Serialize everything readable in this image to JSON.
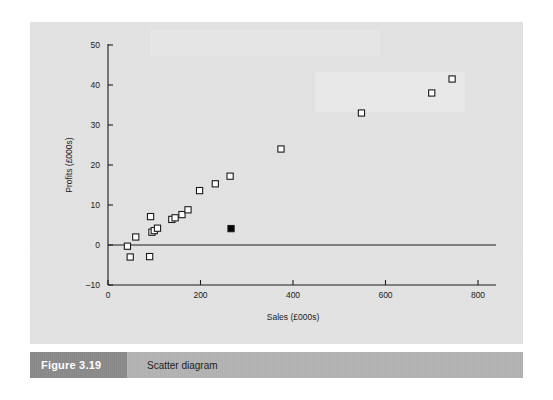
{
  "figure": {
    "caption_number": "Figure 3.19",
    "caption_title": "Scatter diagram"
  },
  "colors": {
    "panel_background": "#e3e3e3",
    "caption_number_bg": "#8b8b8b",
    "caption_bar_bg": "#b4b4b4",
    "axis": "#1a1a1a",
    "marker_open": "#ffffff",
    "marker_outline": "#1a1a1a",
    "marker_highlight": "#000000",
    "page_background": "#ffffff"
  },
  "chart_data": {
    "type": "scatter",
    "title": "",
    "xlabel": "Sales (£000s)",
    "ylabel": "Profits (£000s)",
    "xlim": [
      0,
      800
    ],
    "ylim": [
      -10,
      50
    ],
    "xticks": [
      0,
      200,
      400,
      600,
      800
    ],
    "yticks": [
      -10,
      0,
      10,
      20,
      30,
      40,
      50
    ],
    "xtick_labels": [
      "0",
      "200",
      "400",
      "600",
      "800"
    ],
    "ytick_labels": [
      "–10",
      "0",
      "10",
      "20",
      "30",
      "40",
      "50"
    ],
    "grid": false,
    "legend": "none",
    "zero_line": 0,
    "series": [
      {
        "name": "Branches",
        "marker": "open-square",
        "points": [
          {
            "x": 42,
            "y": -0.3
          },
          {
            "x": 48,
            "y": -3.0
          },
          {
            "x": 60,
            "y": 2.0
          },
          {
            "x": 90,
            "y": -2.9
          },
          {
            "x": 92,
            "y": 7.1
          },
          {
            "x": 95,
            "y": 3.2
          },
          {
            "x": 100,
            "y": 3.6
          },
          {
            "x": 107,
            "y": 4.2
          },
          {
            "x": 138,
            "y": 6.4
          },
          {
            "x": 145,
            "y": 6.8
          },
          {
            "x": 160,
            "y": 7.6
          },
          {
            "x": 173,
            "y": 8.8
          },
          {
            "x": 198,
            "y": 13.6
          },
          {
            "x": 232,
            "y": 15.3
          },
          {
            "x": 264,
            "y": 17.2
          },
          {
            "x": 374,
            "y": 24.0
          },
          {
            "x": 548,
            "y": 33.0
          },
          {
            "x": 700,
            "y": 38.0
          },
          {
            "x": 744,
            "y": 41.5
          }
        ]
      },
      {
        "name": "Highlighted branch",
        "marker": "filled-square",
        "points": [
          {
            "x": 266,
            "y": 4.1
          }
        ]
      }
    ]
  }
}
